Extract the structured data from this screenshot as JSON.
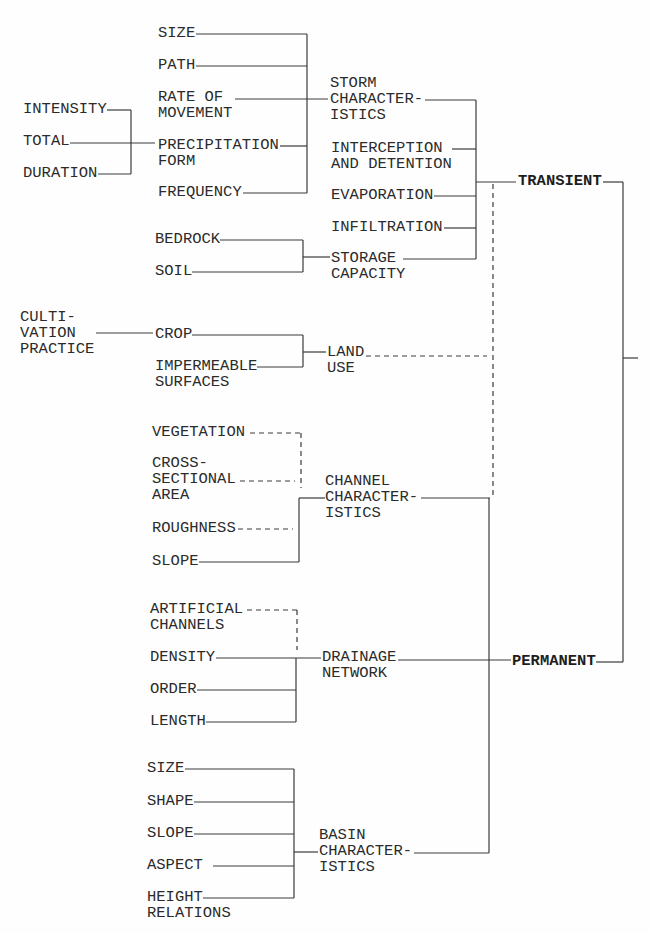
{
  "nodes": {
    "intensity": "INTENSITY",
    "total": "TOTAL",
    "duration": "DURATION",
    "storm_size": "SIZE",
    "path": "PATH",
    "rate_of_movement": "RATE OF\nMOVEMENT",
    "precipitation_form": "PRECIPITATION\nFORM",
    "frequency": "FREQUENCY",
    "storm_characteristics": "STORM\nCHARACTER-\nISTICS",
    "interception_detention": "INTERCEPTION\nAND DETENTION",
    "evaporation": "EVAPORATION",
    "infiltration": "INFILTRATION",
    "bedrock": "BEDROCK",
    "soil": "SOIL",
    "storage_capacity": "STORAGE\nCAPACITY",
    "transient": "TRANSIENT",
    "cultivation_practice": "CULTI-\nVATION\nPRACTICE",
    "crop": "CROP",
    "impermeable_surfaces": "IMPERMEABLE\nSURFACES",
    "land_use": "LAND\nUSE",
    "vegetation": "VEGETATION",
    "cross_sectional_area": "CROSS-\nSECTIONAL\nAREA",
    "roughness": "ROUGHNESS",
    "channel_slope": "SLOPE",
    "channel_characteristics": "CHANNEL\nCHARACTER-\nISTICS",
    "artificial_channels": "ARTIFICIAL\nCHANNELS",
    "density": "DENSITY",
    "order": "ORDER",
    "length": "LENGTH",
    "drainage_network": "DRAINAGE\nNETWORK",
    "permanent": "PERMANENT",
    "basin_size": "SIZE",
    "shape": "SHAPE",
    "basin_slope": "SLOPE",
    "aspect": "ASPECT",
    "height_relations": "HEIGHT\nRELATIONS",
    "basin_characteristics": "BASIN\nCHARACTER-\nISTICS"
  },
  "links": [
    {
      "from": "intensity",
      "to": "precipitation_form",
      "style": "solid"
    },
    {
      "from": "total",
      "to": "precipitation_form",
      "style": "solid"
    },
    {
      "from": "duration",
      "to": "precipitation_form",
      "style": "solid"
    },
    {
      "from": "storm_size",
      "to": "storm_characteristics",
      "style": "solid"
    },
    {
      "from": "path",
      "to": "storm_characteristics",
      "style": "solid"
    },
    {
      "from": "rate_of_movement",
      "to": "storm_characteristics",
      "style": "solid"
    },
    {
      "from": "precipitation_form",
      "to": "storm_characteristics",
      "style": "solid"
    },
    {
      "from": "frequency",
      "to": "storm_characteristics",
      "style": "solid"
    },
    {
      "from": "bedrock",
      "to": "storage_capacity",
      "style": "solid"
    },
    {
      "from": "soil",
      "to": "storage_capacity",
      "style": "solid"
    },
    {
      "from": "storm_characteristics",
      "to": "transient",
      "style": "solid"
    },
    {
      "from": "interception_detention",
      "to": "transient",
      "style": "solid"
    },
    {
      "from": "evaporation",
      "to": "transient",
      "style": "solid"
    },
    {
      "from": "infiltration",
      "to": "transient",
      "style": "solid"
    },
    {
      "from": "storage_capacity",
      "to": "transient",
      "style": "solid"
    },
    {
      "from": "cultivation_practice",
      "to": "crop",
      "style": "solid"
    },
    {
      "from": "crop",
      "to": "land_use",
      "style": "solid"
    },
    {
      "from": "impermeable_surfaces",
      "to": "land_use",
      "style": "solid"
    },
    {
      "from": "land_use",
      "to": "transient",
      "style": "dashed"
    },
    {
      "from": "vegetation",
      "to": "channel_characteristics",
      "style": "dashed"
    },
    {
      "from": "cross_sectional_area",
      "to": "channel_characteristics",
      "style": "dashed"
    },
    {
      "from": "roughness",
      "to": "channel_characteristics",
      "style": "dashed"
    },
    {
      "from": "channel_slope",
      "to": "channel_characteristics",
      "style": "solid"
    },
    {
      "from": "channel_characteristics",
      "to": "transient",
      "style": "dashed"
    },
    {
      "from": "channel_characteristics",
      "to": "permanent",
      "style": "solid"
    },
    {
      "from": "artificial_channels",
      "to": "drainage_network",
      "style": "dashed"
    },
    {
      "from": "density",
      "to": "drainage_network",
      "style": "solid"
    },
    {
      "from": "order",
      "to": "drainage_network",
      "style": "solid"
    },
    {
      "from": "length",
      "to": "drainage_network",
      "style": "solid"
    },
    {
      "from": "drainage_network",
      "to": "permanent",
      "style": "solid"
    },
    {
      "from": "basin_size",
      "to": "basin_characteristics",
      "style": "solid"
    },
    {
      "from": "shape",
      "to": "basin_characteristics",
      "style": "solid"
    },
    {
      "from": "basin_slope",
      "to": "basin_characteristics",
      "style": "solid"
    },
    {
      "from": "aspect",
      "to": "basin_characteristics",
      "style": "solid"
    },
    {
      "from": "height_relations",
      "to": "basin_characteristics",
      "style": "solid"
    },
    {
      "from": "basin_characteristics",
      "to": "permanent",
      "style": "solid"
    },
    {
      "from": "transient",
      "to": "output",
      "style": "solid"
    },
    {
      "from": "permanent",
      "to": "output",
      "style": "solid"
    }
  ],
  "colors": {
    "text": "#2b2b2b",
    "lines": "#3a3a3a",
    "background": "#fefefe"
  }
}
